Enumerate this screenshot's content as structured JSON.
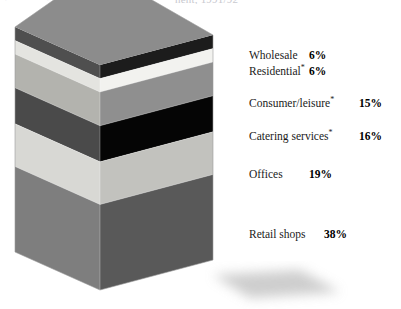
{
  "title_fragment": {
    "part1": "·",
    "part2": "·",
    "part3": "nent, 1991/92"
  },
  "chart_data": {
    "type": "bar",
    "title": "",
    "subtitle": "",
    "xlabel": "",
    "ylabel": "",
    "grid": false,
    "legend_position": "right",
    "orientation": "vertical-stacked-3d",
    "units": "%",
    "total": 100,
    "categories": [
      "Wholesale",
      "Residential*",
      "Consumer/leisure*",
      "Catering services*",
      "Offices",
      "Retail shops"
    ],
    "values": [
      6,
      6,
      15,
      16,
      19,
      38
    ],
    "value_labels": [
      "6%",
      "6%",
      "15%",
      "16%",
      "19%",
      "38%"
    ],
    "colors": [
      "#1c1c1c",
      "#f2f2ef",
      "#8f8f8f",
      "#050505",
      "#c2c2be",
      "#595959"
    ],
    "side_colors": [
      "#4f4f4f",
      "#e4e4e0",
      "#b3b3ae",
      "#4a4a4a",
      "#d8d8d4",
      "#7e7e7e"
    ],
    "top_face_color": "#8c8c8c",
    "ylim": [
      0,
      100
    ]
  },
  "legend": {
    "items": [
      {
        "label": "Wholesale",
        "footnote": "",
        "value": "6%",
        "top": 49,
        "value_left": 60
      },
      {
        "label": "Residential",
        "footnote": "*",
        "value": "6%",
        "top": 65,
        "value_left": 60
      },
      {
        "label": "Consumer/leisure",
        "footnote": "*",
        "value": "15%",
        "top": 97,
        "value_left": 110
      },
      {
        "label": "Catering services",
        "footnote": "*",
        "value": "16%",
        "top": 130,
        "value_left": 110
      },
      {
        "label": "Offices",
        "footnote": "",
        "value": "19%",
        "top": 168,
        "value_left": 60
      },
      {
        "label": "Retail shops",
        "footnote": "",
        "value": "38%",
        "top": 228,
        "value_left": 75
      }
    ]
  }
}
